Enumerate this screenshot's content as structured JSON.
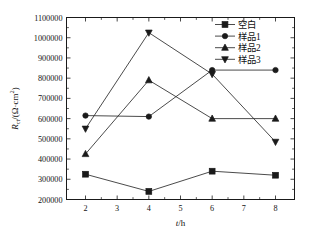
{
  "chart_data": {
    "type": "line",
    "title": "",
    "xlabel": "t/h",
    "ylabel": "R_ct/(Ω·cm²)",
    "ylabel_parts": {
      "main": "R",
      "sub": "ct",
      "unit": "/(Ω·cm",
      "sup": "2",
      "close": ")"
    },
    "x": [
      2,
      4,
      6,
      8
    ],
    "xlim": [
      1.4,
      8.6
    ],
    "ylim": [
      200000,
      1100000
    ],
    "xticks": [
      2,
      3,
      4,
      5,
      6,
      7,
      8
    ],
    "xticklabels": [
      "2",
      "3",
      "4",
      "5",
      "6",
      "7",
      "8"
    ],
    "yticks": [
      200000,
      300000,
      400000,
      500000,
      600000,
      700000,
      800000,
      900000,
      1000000,
      1100000
    ],
    "yticklabels": [
      "200000",
      "300000",
      "400000",
      "500000",
      "600000",
      "700000",
      "800000",
      "900000",
      "1000000",
      "1100000"
    ],
    "grid": false,
    "legend_position": "top-right",
    "series": [
      {
        "name": "空白",
        "marker": "square",
        "color": "#1a1a1a",
        "values": [
          325000,
          240000,
          340000,
          320000
        ]
      },
      {
        "name": "样品1",
        "marker": "circle",
        "color": "#1a1a1a",
        "values": [
          615000,
          610000,
          840000,
          840000
        ]
      },
      {
        "name": "样品2",
        "marker": "triangle-up",
        "color": "#1a1a1a",
        "values": [
          425000,
          790000,
          600000,
          600000
        ]
      },
      {
        "name": "样品3",
        "marker": "triangle-down",
        "color": "#1a1a1a",
        "values": [
          550000,
          1025000,
          820000,
          485000
        ]
      }
    ]
  },
  "figure": {
    "background": "#ffffff",
    "axis_color": "#1a1a1a"
  }
}
